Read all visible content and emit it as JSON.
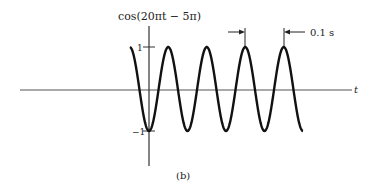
{
  "chart_data": {
    "type": "line",
    "title": "cos(20πt − 5π)",
    "xlabel": "t",
    "ylabel": "cos(20πt − 5π)",
    "caption": "(b)",
    "y_ticks": [
      "1",
      "−1"
    ],
    "ylim": [
      -1,
      1
    ],
    "period_annotation": "0.1 s",
    "function": "cos(20*pi*t - 5*pi)",
    "period_s": 0.1,
    "cycles_shown": 4.5,
    "series": [
      {
        "name": "cos(20πt − 5π)",
        "description": "sinusoid with amplitude 1, period 0.1 s, minimum (−1) at t = 0"
      }
    ]
  },
  "labels": {
    "ylabel": "cos(20πt − 5π)",
    "xlabel": "t",
    "tick_pos": "1",
    "tick_neg": "−1",
    "period": "0.1 s",
    "caption": "(b)"
  }
}
